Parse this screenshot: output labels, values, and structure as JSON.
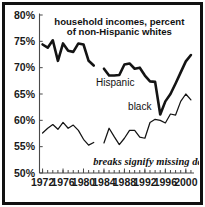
{
  "chart_data": {
    "type": "line",
    "title_line1": "household incomes, percent",
    "title_line2": "of non-Hispanic whites",
    "xlabel": "",
    "ylabel": "",
    "annotation": "breaks signify missing data",
    "grid": false,
    "legend_position": "inline-labels",
    "ylim": [
      50,
      80
    ],
    "xlim": [
      1971.4,
      2001.6
    ],
    "ytick_labels": [
      "80%",
      "75%",
      "70%",
      "65%",
      "60%",
      "55%",
      "50%"
    ],
    "ytick_values": [
      80,
      75,
      70,
      65,
      60,
      55,
      50
    ],
    "xtick_labels": [
      "1972",
      "1976",
      "1980",
      "1984",
      "1988",
      "1992",
      "1996",
      "2000"
    ],
    "xtick_values": [
      1972,
      1976,
      1980,
      1984,
      1988,
      1992,
      1996,
      2000
    ],
    "xtick_minor_values": [
      1972,
      1973,
      1974,
      1975,
      1976,
      1977,
      1978,
      1979,
      1980,
      1981,
      1982,
      1983,
      1984,
      1985,
      1986,
      1987,
      1988,
      1989,
      1990,
      1991,
      1992,
      1993,
      1994,
      1995,
      1996,
      1997,
      1998,
      1999,
      2000,
      2001
    ],
    "series": [
      {
        "name": "Hispanic",
        "label": "Hispanic",
        "style": "thick",
        "segments": [
          {
            "x": [
              1972,
              1973,
              1974,
              1975,
              1976,
              1977,
              1978,
              1979,
              1980,
              1981,
              1982
            ],
            "values": [
              74.4,
              73.8,
              75.2,
              71.3,
              74.6,
              73.2,
              73.0,
              74.6,
              74.4,
              71.3,
              70.4
            ]
          },
          {
            "x": [
              1984,
              1985,
              1986,
              1987,
              1988,
              1989,
              1990,
              1991,
              1992,
              1993,
              1994,
              1995,
              1996,
              1997,
              1998,
              1999,
              2000,
              2001
            ],
            "values": [
              69.8,
              68.5,
              68.5,
              68.6,
              70.6,
              70.8,
              69.8,
              70.0,
              68.5,
              67.4,
              67.3,
              61.1,
              63.6,
              65.0,
              67.0,
              69.1,
              71.2,
              72.4
            ]
          }
        ]
      },
      {
        "name": "black",
        "label": "black",
        "style": "thin",
        "segments": [
          {
            "x": [
              1972,
              1973,
              1974,
              1975,
              1976,
              1977,
              1978,
              1979,
              1980,
              1981,
              1982
            ],
            "values": [
              57.6,
              58.5,
              59.2,
              58.3,
              59.6,
              58.5,
              59.1,
              58.1,
              56.4,
              55.3,
              55.8
            ]
          },
          {
            "x": [
              1984,
              1985,
              1986,
              1987,
              1988,
              1989,
              1990,
              1991,
              1992,
              1993,
              1994,
              1995,
              1996,
              1997,
              1998,
              1999,
              2000,
              2001
            ],
            "values": [
              55.7,
              58.5,
              56.9,
              55.4,
              56.6,
              58.1,
              58.1,
              56.8,
              56.6,
              59.6,
              60.2,
              60.0,
              59.5,
              61.2,
              61.0,
              63.6,
              65.0,
              63.9
            ]
          }
        ]
      }
    ],
    "series_label_positions": [
      {
        "name": "Hispanic",
        "x": 1986.2,
        "y": 66.6
      },
      {
        "name": "black",
        "x": 1991.0,
        "y": 61.9
      }
    ]
  },
  "colors": {
    "frame": "#111111",
    "line": "#141414",
    "axis": "#4a4a4a",
    "background": "#ffffff",
    "text": "#111111"
  }
}
